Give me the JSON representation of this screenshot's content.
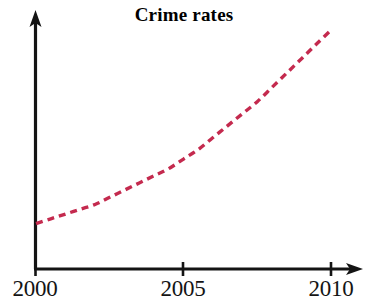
{
  "chart_data": {
    "type": "line",
    "title": "Crime rates",
    "subtitle": "",
    "xlabel": "",
    "ylabel": "",
    "xlim": [
      2000,
      2010
    ],
    "ylim": [
      0,
      100
    ],
    "grid": false,
    "legend": null,
    "xticks": [
      "2000",
      "2005",
      "2010"
    ],
    "xtick_values": [
      2000,
      2005,
      2010
    ],
    "yticks": [],
    "axis_style": "arrow-ended L-shaped axes, no y-axis tick labels",
    "series": [
      {
        "name": "Crime rates",
        "style": "dashed",
        "color": "#C42A4E",
        "x": [
          2000,
          2000.5,
          2001,
          2001.5,
          2002,
          2002.5,
          2003,
          2003.5,
          2004,
          2004.5,
          2005,
          2005.5,
          2006,
          2006.5,
          2007,
          2007.5,
          2008,
          2008.5,
          2009,
          2009.5,
          2010
        ],
        "values": [
          19,
          21,
          23,
          25,
          27,
          30,
          33,
          36,
          39,
          42,
          46,
          50,
          55,
          60,
          65,
          70,
          76,
          82,
          88,
          94,
          100
        ],
        "trend": "increasing, convex upward (accelerating growth)"
      }
    ],
    "annotations": []
  },
  "chart": {
    "title": "Crime rates",
    "axes": {
      "x_axis_name": "x-axis-year",
      "y_axis_name": "y-axis-rate"
    },
    "ticks": [
      {
        "label": "2000",
        "x_px": 35
      },
      {
        "label": "2005",
        "x_px": 183
      },
      {
        "label": "2010",
        "x_px": 331
      }
    ],
    "colors": {
      "axis": "#141414",
      "series": "#C42A4E",
      "background": "#FFFFFF"
    }
  }
}
